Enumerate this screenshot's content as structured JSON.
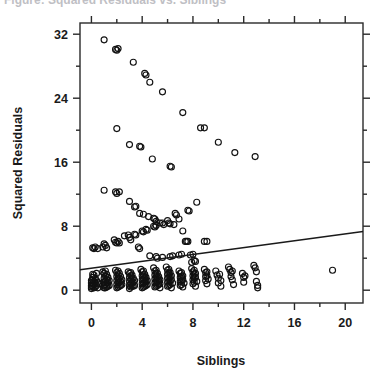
{
  "figure": {
    "cropped_header_text": "Figure: Squared Residuals vs. Siblings"
  },
  "chart_data": {
    "type": "scatter",
    "title": "",
    "xlabel": "Siblings",
    "ylabel": "Squared Residuals",
    "xlim": [
      -0.9,
      21.4
    ],
    "ylim": [
      -1.6,
      33.4
    ],
    "grid": false,
    "legend": null,
    "xticks": [
      0,
      4,
      8,
      12,
      16,
      20
    ],
    "xticklabels": [
      "0",
      "4",
      "8",
      "12",
      "16",
      "20"
    ],
    "xminorticks": [
      2,
      6,
      10,
      14,
      18
    ],
    "yticks": [
      0,
      8,
      16,
      24,
      32
    ],
    "yticklabels": [
      "0",
      "8",
      "16",
      "24",
      "32"
    ],
    "yminorticks": [
      4,
      12,
      20,
      28
    ],
    "marker": "open-circle",
    "marker_size": 3.0,
    "trendline": {
      "type": "linear",
      "x_start": -0.9,
      "y_start": 2.55,
      "x_end": 21.4,
      "y_end": 7.35,
      "slope": 0.215,
      "intercept": 2.744
    },
    "points": [
      [
        1.0,
        31.3
      ],
      [
        1.9,
        30.1
      ],
      [
        2.1,
        30.2
      ],
      [
        2.0,
        30.0
      ],
      [
        3.3,
        28.5
      ],
      [
        4.2,
        27.1
      ],
      [
        4.3,
        26.9
      ],
      [
        4.6,
        26.0
      ],
      [
        5.6,
        24.8
      ],
      [
        7.2,
        22.2
      ],
      [
        8.6,
        20.3
      ],
      [
        8.9,
        20.3
      ],
      [
        10.0,
        18.5
      ],
      [
        11.3,
        17.2
      ],
      [
        12.9,
        16.7
      ],
      [
        2.0,
        20.2
      ],
      [
        3.0,
        18.2
      ],
      [
        3.8,
        18.0
      ],
      [
        3.9,
        17.9
      ],
      [
        4.8,
        16.4
      ],
      [
        6.2,
        15.5
      ],
      [
        6.3,
        15.4
      ],
      [
        1.0,
        12.5
      ],
      [
        1.9,
        12.3
      ],
      [
        2.2,
        12.3
      ],
      [
        2.0,
        12.1
      ],
      [
        3.0,
        11.1
      ],
      [
        3.4,
        10.4
      ],
      [
        3.5,
        10.5
      ],
      [
        3.8,
        9.6
      ],
      [
        4.1,
        9.5
      ],
      [
        4.5,
        9.2
      ],
      [
        4.9,
        9.0
      ],
      [
        5.0,
        8.9
      ],
      [
        5.1,
        8.6
      ],
      [
        5.4,
        8.4
      ],
      [
        6.0,
        8.7
      ],
      [
        6.1,
        8.4
      ],
      [
        6.6,
        9.6
      ],
      [
        6.7,
        9.4
      ],
      [
        7.6,
        10.0
      ],
      [
        7.7,
        9.9
      ],
      [
        8.3,
        11.0
      ],
      [
        6.9,
        8.9
      ],
      [
        6.5,
        8.2
      ],
      [
        7.2,
        7.4
      ],
      [
        7.4,
        6.1
      ],
      [
        7.5,
        6.1
      ],
      [
        7.6,
        6.1
      ],
      [
        8.9,
        6.1
      ],
      [
        9.1,
        6.1
      ],
      [
        0.1,
        5.3
      ],
      [
        0.2,
        5.2
      ],
      [
        0.3,
        5.4
      ],
      [
        0.5,
        5.2
      ],
      [
        0.9,
        5.4
      ],
      [
        1.0,
        5.8
      ],
      [
        1.1,
        5.6
      ],
      [
        1.2,
        5.3
      ],
      [
        1.8,
        6.3
      ],
      [
        1.9,
        6.0
      ],
      [
        2.0,
        5.9
      ],
      [
        2.1,
        6.1
      ],
      [
        2.2,
        5.9
      ],
      [
        2.6,
        6.8
      ],
      [
        2.9,
        6.9
      ],
      [
        3.0,
        6.6
      ],
      [
        3.1,
        6.3
      ],
      [
        3.4,
        7.0
      ],
      [
        3.5,
        6.9
      ],
      [
        3.7,
        5.4
      ],
      [
        3.8,
        5.2
      ],
      [
        4.0,
        7.4
      ],
      [
        4.1,
        7.3
      ],
      [
        4.3,
        7.6
      ],
      [
        4.4,
        7.5
      ],
      [
        4.9,
        8.0
      ],
      [
        5.0,
        7.9
      ],
      [
        5.1,
        8.1
      ],
      [
        5.6,
        8.4
      ],
      [
        5.7,
        8.2
      ],
      [
        6.2,
        8.3
      ],
      [
        4.6,
        4.3
      ],
      [
        5.1,
        4.2
      ],
      [
        5.2,
        4.0
      ],
      [
        5.6,
        4.1
      ],
      [
        6.2,
        4.2
      ],
      [
        6.4,
        4.3
      ],
      [
        6.9,
        4.4
      ],
      [
        7.1,
        4.5
      ],
      [
        7.8,
        4.4
      ],
      [
        8.0,
        4.5
      ],
      [
        8.1,
        3.7
      ],
      [
        8.2,
        3.6
      ],
      [
        7.9,
        3.5
      ],
      [
        0.0,
        1.2
      ],
      [
        0.0,
        0.9
      ],
      [
        0.0,
        0.6
      ],
      [
        0.0,
        0.4
      ],
      [
        0.0,
        0.2
      ],
      [
        0.1,
        2.0
      ],
      [
        0.1,
        1.6
      ],
      [
        0.1,
        1.3
      ],
      [
        0.1,
        0.8
      ],
      [
        0.1,
        0.5
      ],
      [
        0.2,
        1.9
      ],
      [
        0.2,
        1.1
      ],
      [
        0.2,
        0.7
      ],
      [
        0.2,
        0.3
      ],
      [
        0.3,
        1.5
      ],
      [
        0.3,
        0.9
      ],
      [
        0.3,
        0.4
      ],
      [
        0.4,
        2.1
      ],
      [
        0.4,
        1.2
      ],
      [
        0.4,
        0.6
      ],
      [
        0.5,
        1.0
      ],
      [
        0.5,
        0.3
      ],
      [
        0.6,
        0.8
      ],
      [
        0.9,
        2.3
      ],
      [
        1.0,
        2.1
      ],
      [
        1.0,
        1.5
      ],
      [
        1.0,
        1.0
      ],
      [
        1.0,
        0.6
      ],
      [
        1.0,
        0.3
      ],
      [
        1.1,
        2.4
      ],
      [
        1.1,
        1.8
      ],
      [
        1.1,
        1.2
      ],
      [
        1.1,
        0.7
      ],
      [
        1.1,
        0.3
      ],
      [
        1.2,
        2.0
      ],
      [
        1.2,
        1.4
      ],
      [
        1.2,
        0.9
      ],
      [
        1.2,
        0.4
      ],
      [
        1.3,
        1.6
      ],
      [
        1.3,
        1.0
      ],
      [
        1.3,
        0.5
      ],
      [
        1.4,
        1.2
      ],
      [
        1.4,
        0.6
      ],
      [
        1.9,
        2.5
      ],
      [
        2.0,
        2.2
      ],
      [
        2.0,
        1.7
      ],
      [
        2.0,
        1.2
      ],
      [
        2.0,
        0.7
      ],
      [
        2.0,
        0.3
      ],
      [
        2.1,
        2.4
      ],
      [
        2.1,
        1.9
      ],
      [
        2.1,
        1.4
      ],
      [
        2.1,
        0.9
      ],
      [
        2.1,
        0.4
      ],
      [
        2.2,
        2.1
      ],
      [
        2.2,
        1.5
      ],
      [
        2.2,
        1.0
      ],
      [
        2.2,
        0.5
      ],
      [
        2.3,
        1.7
      ],
      [
        2.3,
        1.1
      ],
      [
        2.3,
        0.6
      ],
      [
        2.4,
        1.3
      ],
      [
        2.4,
        0.7
      ],
      [
        2.9,
        2.3
      ],
      [
        3.0,
        2.1
      ],
      [
        3.0,
        1.6
      ],
      [
        3.0,
        1.1
      ],
      [
        3.0,
        0.6
      ],
      [
        3.0,
        0.2
      ],
      [
        3.1,
        2.2
      ],
      [
        3.1,
        1.8
      ],
      [
        3.1,
        1.3
      ],
      [
        3.1,
        0.8
      ],
      [
        3.1,
        0.4
      ],
      [
        3.2,
        1.9
      ],
      [
        3.2,
        1.4
      ],
      [
        3.2,
        0.9
      ],
      [
        3.2,
        0.5
      ],
      [
        3.3,
        1.5
      ],
      [
        3.3,
        1.0
      ],
      [
        3.3,
        0.5
      ],
      [
        3.4,
        1.2
      ],
      [
        3.4,
        0.6
      ],
      [
        3.9,
        2.6
      ],
      [
        4.0,
        2.3
      ],
      [
        4.0,
        1.8
      ],
      [
        4.0,
        1.3
      ],
      [
        4.0,
        0.8
      ],
      [
        4.0,
        0.3
      ],
      [
        4.1,
        2.4
      ],
      [
        4.1,
        1.9
      ],
      [
        4.1,
        1.4
      ],
      [
        4.1,
        0.9
      ],
      [
        4.1,
        0.4
      ],
      [
        4.2,
        2.0
      ],
      [
        4.2,
        1.5
      ],
      [
        4.2,
        1.0
      ],
      [
        4.2,
        0.5
      ],
      [
        4.3,
        1.6
      ],
      [
        4.3,
        1.1
      ],
      [
        4.3,
        0.6
      ],
      [
        4.4,
        1.2
      ],
      [
        4.4,
        0.7
      ],
      [
        4.9,
        2.8
      ],
      [
        5.0,
        2.4
      ],
      [
        5.0,
        1.9
      ],
      [
        5.0,
        1.4
      ],
      [
        5.0,
        0.9
      ],
      [
        5.0,
        0.4
      ],
      [
        5.1,
        2.5
      ],
      [
        5.1,
        2.0
      ],
      [
        5.1,
        1.5
      ],
      [
        5.1,
        1.0
      ],
      [
        5.1,
        0.5
      ],
      [
        5.2,
        2.1
      ],
      [
        5.2,
        1.6
      ],
      [
        5.2,
        1.1
      ],
      [
        5.2,
        0.6
      ],
      [
        5.3,
        1.7
      ],
      [
        5.3,
        1.2
      ],
      [
        5.3,
        0.7
      ],
      [
        5.4,
        1.3
      ],
      [
        5.4,
        0.8
      ],
      [
        5.4,
        0.3
      ],
      [
        5.9,
        2.9
      ],
      [
        6.0,
        2.5
      ],
      [
        6.0,
        2.0
      ],
      [
        6.0,
        1.5
      ],
      [
        6.0,
        1.0
      ],
      [
        6.0,
        0.5
      ],
      [
        6.1,
        2.6
      ],
      [
        6.1,
        2.1
      ],
      [
        6.1,
        1.6
      ],
      [
        6.1,
        1.1
      ],
      [
        6.1,
        0.6
      ],
      [
        6.2,
        2.2
      ],
      [
        6.2,
        1.7
      ],
      [
        6.2,
        1.2
      ],
      [
        6.2,
        0.7
      ],
      [
        6.3,
        1.8
      ],
      [
        6.3,
        1.3
      ],
      [
        6.3,
        0.3
      ],
      [
        6.4,
        0.9
      ],
      [
        6.9,
        2.4
      ],
      [
        7.0,
        2.1
      ],
      [
        7.0,
        1.6
      ],
      [
        7.0,
        1.1
      ],
      [
        7.0,
        0.6
      ],
      [
        7.1,
        2.2
      ],
      [
        7.1,
        1.7
      ],
      [
        7.1,
        1.2
      ],
      [
        7.1,
        0.7
      ],
      [
        7.2,
        1.8
      ],
      [
        7.2,
        1.3
      ],
      [
        7.2,
        0.4
      ],
      [
        7.3,
        0.9
      ],
      [
        7.9,
        2.7
      ],
      [
        8.0,
        2.3
      ],
      [
        8.0,
        1.8
      ],
      [
        8.0,
        1.3
      ],
      [
        8.0,
        0.8
      ],
      [
        8.1,
        2.5
      ],
      [
        8.1,
        2.0
      ],
      [
        8.1,
        1.5
      ],
      [
        8.1,
        1.0
      ],
      [
        8.2,
        2.1
      ],
      [
        8.2,
        1.6
      ],
      [
        8.2,
        0.5
      ],
      [
        8.3,
        1.1
      ],
      [
        8.9,
        2.6
      ],
      [
        9.0,
        2.2
      ],
      [
        9.0,
        1.7
      ],
      [
        9.0,
        1.2
      ],
      [
        9.1,
        2.3
      ],
      [
        9.1,
        1.8
      ],
      [
        9.1,
        0.8
      ],
      [
        9.2,
        1.4
      ],
      [
        9.8,
        2.4
      ],
      [
        9.9,
        1.9
      ],
      [
        10.0,
        1.5
      ],
      [
        10.0,
        0.9
      ],
      [
        10.1,
        2.0
      ],
      [
        10.2,
        1.2
      ],
      [
        10.2,
        0.5
      ],
      [
        10.8,
        2.9
      ],
      [
        10.9,
        2.6
      ],
      [
        11.0,
        2.2
      ],
      [
        11.0,
        1.7
      ],
      [
        11.1,
        2.4
      ],
      [
        11.1,
        1.3
      ],
      [
        11.2,
        0.7
      ],
      [
        11.9,
        2.1
      ],
      [
        12.0,
        1.6
      ],
      [
        12.0,
        1.0
      ],
      [
        12.1,
        1.8
      ],
      [
        12.8,
        3.1
      ],
      [
        12.9,
        2.8
      ],
      [
        13.0,
        2.3
      ],
      [
        13.0,
        1.1
      ],
      [
        13.1,
        0.6
      ],
      [
        13.1,
        0.3
      ],
      [
        19.0,
        2.5
      ]
    ]
  }
}
